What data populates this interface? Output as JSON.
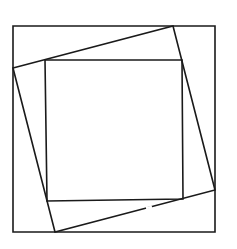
{
  "diagram": {
    "type": "nested-squares",
    "stroke_color": "#1a1a1a",
    "background": "#ffffff",
    "stroke_width": 1.6,
    "outer_square": {
      "points": [
        [
          13,
          26
        ],
        [
          215,
          26
        ],
        [
          215,
          232
        ],
        [
          13,
          232
        ]
      ]
    },
    "tilted_square": {
      "points": [
        [
          13,
          68
        ],
        [
          173,
          26
        ],
        [
          215,
          190
        ],
        [
          55,
          232
        ]
      ]
    },
    "inner_square": {
      "points": [
        [
          45,
          60
        ],
        [
          182,
          60
        ],
        [
          183,
          199
        ],
        [
          47,
          201
        ]
      ]
    },
    "gap_segment": {
      "from": [
        146,
        208
      ],
      "to": [
        152,
        207
      ]
    }
  }
}
